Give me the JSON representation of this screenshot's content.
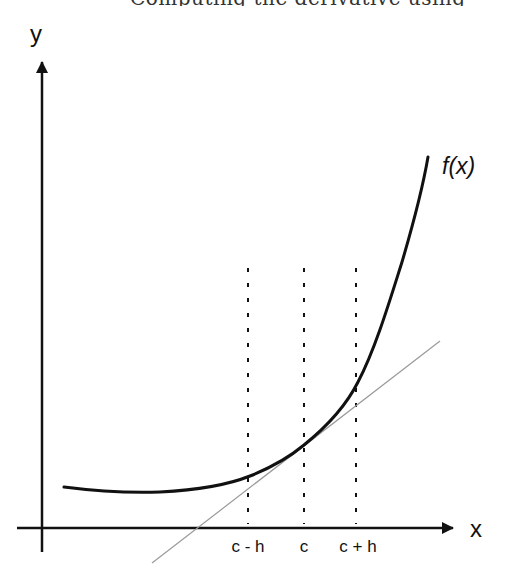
{
  "header": {
    "cutoff_text": "Computing the derivative using"
  },
  "axes": {
    "x_label": "x",
    "y_label": "y"
  },
  "function": {
    "label": "f(x)",
    "description": "convex, rapidly increasing curve"
  },
  "ticks": {
    "c_minus_h": "c - h",
    "c": "c",
    "c_plus_h": "c + h"
  },
  "elements": {
    "tangent_line": "tangent line at x = c",
    "dashed_verticals": [
      "c - h",
      "c",
      "c + h"
    ]
  },
  "colors": {
    "curve": "#111111",
    "axes": "#111111",
    "tangent": "#9a9a9a",
    "dashed": "#111111",
    "background": "#ffffff"
  }
}
